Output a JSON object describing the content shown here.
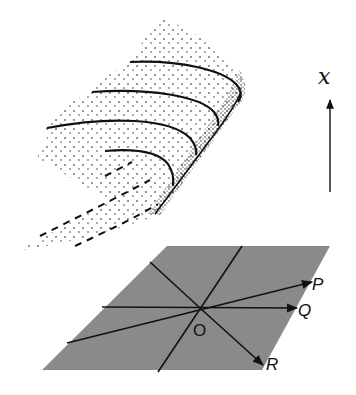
{
  "figure": {
    "colors": {
      "plane": "#8a8a8a",
      "ink": "#111111",
      "background": "#ffffff"
    },
    "axis": {
      "label": "x",
      "direction": "up"
    },
    "plane": {
      "origin_label": "O",
      "rays": [
        {
          "label": "P"
        },
        {
          "label": "Q"
        },
        {
          "label": "R"
        }
      ]
    },
    "surface": {
      "solid_curves": 4,
      "dashed_curves": 3,
      "style": "stippled"
    }
  }
}
